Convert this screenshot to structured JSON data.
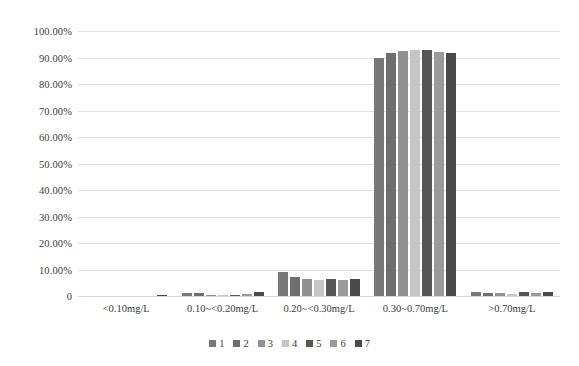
{
  "chart_data": {
    "type": "bar",
    "title": "",
    "subtitle": "",
    "xlabel": "",
    "ylabel": "",
    "ylim": [
      0,
      100
    ],
    "grid": true,
    "legend_position": "bottom",
    "categories": [
      "<0.10mg/L",
      "0.10~<0.20mg/L",
      "0.20~<0.30mg/L",
      "0.30~0.70mg/L",
      ">0.70mg/L"
    ],
    "ytick_labels": [
      "100.00%",
      "90.00%",
      "80.00%",
      "70.00%",
      "60.00%",
      "50.00%",
      "40.00%",
      "30.00%",
      "20.00%",
      "10.00%",
      "0"
    ],
    "ytick_values": [
      100,
      90,
      80,
      70,
      60,
      50,
      40,
      30,
      20,
      10,
      0
    ],
    "series": [
      {
        "name": "1",
        "color": "#787878",
        "values": [
          0.0,
          1.0,
          9.0,
          90.0,
          1.4
        ]
      },
      {
        "name": "2",
        "color": "#6e6e6e",
        "values": [
          0.0,
          1.0,
          7.0,
          91.8,
          1.3
        ]
      },
      {
        "name": "3",
        "color": "#909090",
        "values": [
          0.0,
          0.4,
          6.3,
          92.6,
          1.1
        ]
      },
      {
        "name": "4",
        "color": "#c6c6c6",
        "values": [
          0.0,
          0.3,
          6.0,
          93.0,
          0.7
        ]
      },
      {
        "name": "5",
        "color": "#565656",
        "values": [
          0.0,
          0.4,
          6.4,
          93.0,
          1.5
        ]
      },
      {
        "name": "6",
        "color": "#9a9a9a",
        "values": [
          0.0,
          0.8,
          6.2,
          92.0,
          1.0
        ]
      },
      {
        "name": "7",
        "color": "#4a4a4a",
        "values": [
          0.3,
          1.6,
          6.3,
          91.8,
          1.7
        ]
      }
    ]
  },
  "legend": {
    "items": [
      {
        "label": "1"
      },
      {
        "label": "2"
      },
      {
        "label": "3"
      },
      {
        "label": "4"
      },
      {
        "label": "5"
      },
      {
        "label": "6"
      },
      {
        "label": "7"
      }
    ]
  }
}
